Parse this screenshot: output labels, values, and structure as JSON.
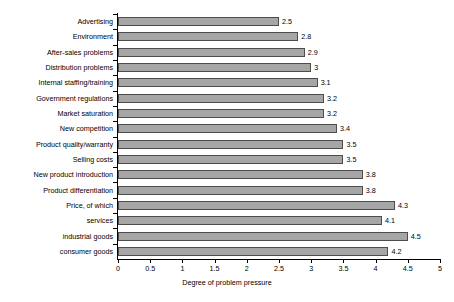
{
  "chart_data": {
    "type": "bar",
    "orientation": "horizontal",
    "title": "",
    "xlabel": "Degree of problem pressure",
    "ylabel": "",
    "xlim": [
      0,
      5
    ],
    "xticks": [
      0,
      0.5,
      1,
      1.5,
      2,
      2.5,
      3,
      3.5,
      4,
      4.5,
      5
    ],
    "xtick_labels": [
      "0",
      "0.5",
      "1",
      "1.5",
      "2",
      "2.5",
      "3",
      "3.5",
      "4",
      "4.5",
      "5"
    ],
    "grid": false,
    "legend": null,
    "bar_fill_color": "#a6a6a6",
    "bar_border_color": "#4d4d4d",
    "categories": [
      "Advertising",
      "Environment",
      "After-sales problems",
      "Distribution problems",
      "Internal staffing/training",
      "Government regulations",
      "Market saturation",
      "New competition",
      "Product quality/warranty",
      "Selling costs",
      "New product introduction",
      "Product differentiation",
      "Price, of which",
      "services",
      "industrial goods",
      "consumer goods"
    ],
    "values": [
      2.5,
      2.8,
      2.9,
      3,
      3.1,
      3.2,
      3.2,
      3.4,
      3.5,
      3.5,
      3.8,
      3.8,
      4.3,
      4.1,
      4.5,
      4.2
    ],
    "value_labels": [
      "2.5",
      "2.8",
      "2.9",
      "3",
      "3.1",
      "3.2",
      "3.2",
      "3.4",
      "3.5",
      "3.5",
      "3.8",
      "3.8",
      "4.3",
      "4.1",
      "4.5",
      "4.2"
    ]
  }
}
